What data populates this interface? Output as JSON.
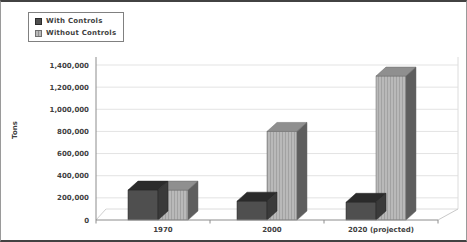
{
  "frame": {
    "background": "#ffffff",
    "border_color": "#424242"
  },
  "chart_data": {
    "type": "bar",
    "projection": "3d-column",
    "title": "",
    "xlabel": "",
    "ylabel": "Tons",
    "categories": [
      "1970",
      "2000",
      "2020 (projected)"
    ],
    "series": [
      {
        "name": "With Controls",
        "values": [
          270000,
          170000,
          160000
        ],
        "pattern": "solid",
        "color_front": "#4f4f4f",
        "color_top": "#2b2b2b",
        "color_side": "#3a3a3a"
      },
      {
        "name": "Without Controls",
        "values": [
          270000,
          800000,
          1300000
        ],
        "pattern": "striped",
        "color_front": "#b9b9b9",
        "color_stripe": "#a0a0a0",
        "color_top": "#8f8f8f",
        "color_side": "#5e5e5e"
      }
    ],
    "ylim": [
      0,
      1400000
    ],
    "ytick_step": 200000,
    "ytick_labels": [
      "0",
      "200,000",
      "400,000",
      "600,000",
      "800,000",
      "1,000,000",
      "1,200,000",
      "1,400,000"
    ],
    "grid": true,
    "legend_position": "top-left",
    "axis_color": "#8c8c8c",
    "gridline_color": "#e3e3e3",
    "floor_color": "#c9c9c9",
    "text_color": "#3f3f3f"
  }
}
